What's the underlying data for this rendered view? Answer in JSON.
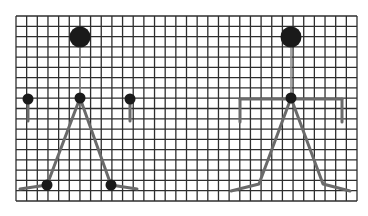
{
  "canvas": {
    "width": 368,
    "height": 216,
    "background": "#ffffff"
  },
  "grid": {
    "x0": 16,
    "y0": 16,
    "x1": 357,
    "y1": 201,
    "columns": 32,
    "rows": 18,
    "line_color": "#2e2e2e"
  },
  "colors": {
    "joint": "#1a1a1a",
    "limb": "#6a6a6a",
    "spine": "#8a8a8a"
  },
  "figures": [
    {
      "id": "figure-left",
      "head": {
        "cx": 80,
        "cy": 37,
        "r": 10.5
      },
      "spine": [
        [
          80,
          47
        ],
        [
          80,
          98
        ]
      ],
      "hip": {
        "cx": 80,
        "cy": 98,
        "r": 5.5
      },
      "arm_joints": [
        {
          "cx": 28,
          "cy": 99,
          "r": 5.5
        },
        {
          "cx": 130,
          "cy": 99,
          "r": 5.5
        }
      ],
      "arm_stems": [
        [
          [
            28,
            99
          ],
          [
            28,
            121
          ]
        ],
        [
          [
            130,
            99
          ],
          [
            130,
            121
          ]
        ]
      ],
      "shoulder_bar": null,
      "legs": [
        [
          [
            80,
            98
          ],
          [
            47,
            185
          ],
          [
            20,
            189
          ]
        ],
        [
          [
            80,
            98
          ],
          [
            111,
            185
          ],
          [
            137,
            189
          ]
        ]
      ],
      "foot_joints": [
        {
          "cx": 47,
          "cy": 185,
          "r": 5.5
        },
        {
          "cx": 111,
          "cy": 185,
          "r": 5.5
        }
      ]
    },
    {
      "id": "figure-right",
      "head": {
        "cx": 291,
        "cy": 37,
        "r": 10.5
      },
      "spine": [
        [
          291,
          47
        ],
        [
          291,
          98
        ]
      ],
      "hip": {
        "cx": 291,
        "cy": 98,
        "r": 5.5
      },
      "arm_joints": [],
      "arm_stems": [
        [
          [
            240,
            99
          ],
          [
            240,
            122
          ]
        ],
        [
          [
            342,
            99
          ],
          [
            342,
            122
          ]
        ]
      ],
      "shoulder_bar": [
        [
          240,
          99
        ],
        [
          342,
          99
        ]
      ],
      "legs": [
        [
          [
            291,
            98
          ],
          [
            259,
            184
          ],
          [
            231,
            191
          ]
        ],
        [
          [
            291,
            98
          ],
          [
            323,
            184
          ],
          [
            350,
            191
          ]
        ]
      ],
      "foot_joints": []
    }
  ]
}
